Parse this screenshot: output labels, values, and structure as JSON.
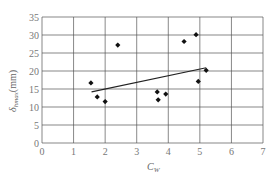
{
  "chart_data": {
    "type": "scatter",
    "title": "",
    "xlabel": "C_w",
    "ylabel": "δ_hmax (mm)",
    "xlim": [
      0,
      7
    ],
    "ylim": [
      0,
      35
    ],
    "xticks": [
      0,
      1,
      2,
      3,
      4,
      5,
      6,
      7
    ],
    "yticks": [
      0,
      5,
      10,
      15,
      20,
      25,
      30,
      35
    ],
    "grid": true,
    "legend": null,
    "series": [
      {
        "name": "measured",
        "marker": "diamond",
        "points": [
          {
            "x": 1.55,
            "y": 16.7
          },
          {
            "x": 1.75,
            "y": 12.8
          },
          {
            "x": 2.0,
            "y": 11.5
          },
          {
            "x": 2.4,
            "y": 27.2
          },
          {
            "x": 3.65,
            "y": 14.2
          },
          {
            "x": 3.68,
            "y": 12.0
          },
          {
            "x": 3.92,
            "y": 13.6
          },
          {
            "x": 4.5,
            "y": 28.2
          },
          {
            "x": 4.88,
            "y": 30.1
          },
          {
            "x": 4.95,
            "y": 17.1
          },
          {
            "x": 5.2,
            "y": 20.2
          }
        ]
      },
      {
        "name": "trend line",
        "type": "line",
        "points": [
          {
            "x": 1.57,
            "y": 14.2
          },
          {
            "x": 5.2,
            "y": 20.9
          }
        ]
      }
    ]
  },
  "axes": {
    "x_label_main": "C",
    "x_label_sub": "W",
    "y_label_main": "δ",
    "y_label_sub": "hmax",
    "y_label_unit": "(mm)"
  }
}
